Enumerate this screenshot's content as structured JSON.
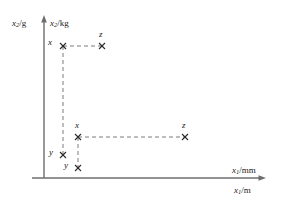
{
  "figure": {
    "type": "coordinate-diagram",
    "background_color": "#ffffff",
    "ink_color": "#3a3a3a",
    "label_color": "#1a1a1a"
  },
  "axes": {
    "vertical": {
      "label_outer": "x",
      "label_outer_sub": "2",
      "label_outer_unit": "/g",
      "label_inner": "x",
      "label_inner_sub": "2",
      "label_inner_unit": "/kg",
      "origin_px": [
        44,
        178
      ],
      "top_px": [
        44,
        18
      ],
      "has_arrow": true
    },
    "horizontal": {
      "label_upper": "x",
      "label_upper_sub": "1",
      "label_upper_unit": "/mm",
      "label_lower": "x",
      "label_lower_sub": "1",
      "label_lower_unit": "/m",
      "origin_px": [
        44,
        178
      ],
      "right_px": [
        266,
        178
      ],
      "has_arrow": true
    }
  },
  "markers": [
    {
      "id": "x-upper",
      "label": "x",
      "x_px": 63,
      "y_px": 46,
      "label_dx": -13,
      "label_dy": -4
    },
    {
      "id": "z-upper",
      "label": "z",
      "x_px": 102,
      "y_px": 46,
      "label_dx": -2,
      "label_dy": -13
    },
    {
      "id": "y-left",
      "label": "y",
      "x_px": 63,
      "y_px": 155,
      "label_dx": -12,
      "label_dy": -3
    },
    {
      "id": "x-middle",
      "label": "x",
      "x_px": 78,
      "y_px": 137,
      "label_dx": -2,
      "label_dy": -13
    },
    {
      "id": "z-middle",
      "label": "z",
      "x_px": 185,
      "y_px": 137,
      "label_dx": -2,
      "label_dy": -13
    },
    {
      "id": "y-middle",
      "label": "y",
      "x_px": 78,
      "y_px": 168,
      "label_dx": -12,
      "label_dy": -3
    }
  ],
  "connectors": [
    {
      "id": "x-upper-to-z-upper",
      "orientation": "horizontal",
      "x1": 63,
      "y1": 46,
      "x2": 102,
      "y2": 46
    },
    {
      "id": "x-upper-to-y-left",
      "orientation": "vertical",
      "x1": 63,
      "y1": 46,
      "x2": 63,
      "y2": 155
    },
    {
      "id": "x-middle-to-z-middle",
      "orientation": "horizontal",
      "x1": 78,
      "y1": 137,
      "x2": 185,
      "y2": 137
    },
    {
      "id": "x-middle-to-y-middle",
      "orientation": "vertical",
      "x1": 78,
      "y1": 137,
      "x2": 78,
      "y2": 168
    }
  ]
}
